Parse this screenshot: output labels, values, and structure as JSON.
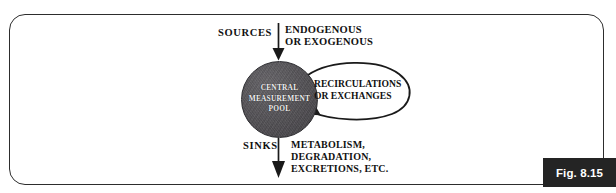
{
  "figure": {
    "number_label": "Fig. 8.15",
    "frame": {
      "border_color": "#2d2d2d",
      "background": "#ffffff"
    }
  },
  "diagram": {
    "type": "flow-diagram",
    "title": "",
    "nodes": [
      {
        "id": "central-pool",
        "label": "CENTRAL\nMEASUREMENT\nPOOL",
        "shape": "circle",
        "fill_color": "#56545a",
        "text_color": "#efeeef"
      }
    ],
    "inflow": {
      "label": "SOURCES",
      "description": "ENDOGENOUS\nOR EXOGENOUS",
      "direction": "down-into-pool"
    },
    "outflow": {
      "label": "SINKS",
      "description": "METABOLISM,\nDEGRADATION,\nEXCRETIONS, ETC.",
      "direction": "down-out-of-pool"
    },
    "loop": {
      "label": "RECIRCULATIONS\nOR EXCHANGES",
      "direction": "self-loop-right"
    },
    "stroke_color": "#1a1a1a"
  }
}
